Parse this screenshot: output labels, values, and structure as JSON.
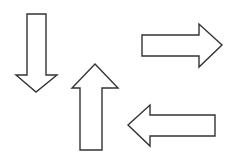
{
  "canvas": {
    "width": 234,
    "height": 164,
    "background_color": "#ffffff",
    "stroke_color": "#333333",
    "fill_color": "#ffffff",
    "stroke_width": 1.4
  },
  "diagram": {
    "shape_count": 4,
    "arrows": [
      {
        "id": "arrow-down",
        "name": "down-arrow",
        "direction": "down",
        "label": "Down arrow",
        "tip": {
          "x": 36,
          "y": 92
        },
        "bounds": {
          "x": 16,
          "y": 14,
          "width": 41,
          "height": 78
        },
        "points": "27,14 46,14 46,75 57,75 36,92 16,75 27,75 27,14"
      },
      {
        "id": "arrow-up",
        "name": "up-arrow",
        "direction": "up",
        "label": "Up arrow",
        "tip": {
          "x": 95,
          "y": 64
        },
        "bounds": {
          "x": 72,
          "y": 64,
          "width": 46,
          "height": 86
        },
        "points": "95,64 118,88 102,88 102,150 80,150 80,88 72,88 95,64"
      },
      {
        "id": "arrow-right",
        "name": "right-arrow",
        "direction": "right",
        "label": "Right arrow",
        "tip": {
          "x": 222,
          "y": 45
        },
        "bounds": {
          "x": 142,
          "y": 24,
          "width": 80,
          "height": 43
        },
        "points": "142,35 199,35 199,24 222,45 199,67 199,56 142,56 142,35"
      },
      {
        "id": "arrow-left",
        "name": "left-arrow",
        "direction": "left",
        "label": "Left arrow",
        "tip": {
          "x": 128,
          "y": 125
        },
        "bounds": {
          "x": 128,
          "y": 105,
          "width": 87,
          "height": 41
        },
        "points": "128,125 150,105 150,115 215,115 215,136 150,136 150,146 128,125"
      }
    ]
  }
}
